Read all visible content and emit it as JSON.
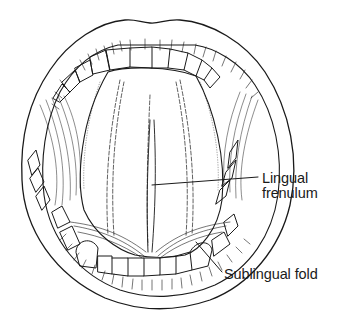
{
  "figure": {
    "labels": [
      {
        "id": "lingual-frenulum",
        "lines": [
          "Lingual",
          "frenulum"
        ]
      },
      {
        "id": "sublingual-fold",
        "text": "Sublingual fold"
      }
    ],
    "colors": {
      "line": "#1a1a1a",
      "background": "#ffffff"
    }
  }
}
